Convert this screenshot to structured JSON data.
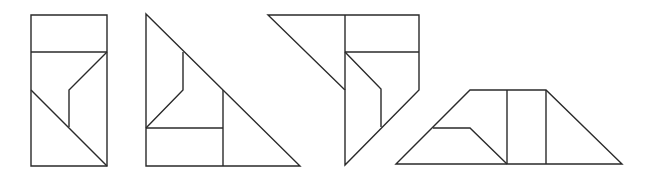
{
  "canvas": {
    "width": 656,
    "height": 176,
    "background": "#ffffff",
    "stroke": "#2a2a2a"
  },
  "figures": [
    {
      "name": "rectangle-tangram",
      "outline": [
        [
          31,
          15
        ],
        [
          107,
          15
        ],
        [
          107,
          166
        ],
        [
          31,
          166
        ]
      ],
      "lines": [
        [
          [
            31,
            52
          ],
          [
            107,
            52
          ]
        ],
        [
          [
            107,
            52
          ],
          [
            69,
            90
          ],
          [
            69,
            127
          ]
        ],
        [
          [
            31,
            90
          ],
          [
            107,
            166
          ]
        ]
      ]
    },
    {
      "name": "triangle-tangram",
      "outline": [
        [
          146,
          14
        ],
        [
          300,
          166
        ],
        [
          146,
          166
        ]
      ],
      "lines": [
        [
          [
            183,
            52
          ],
          [
            183,
            90
          ],
          [
            146,
            128
          ]
        ],
        [
          [
            146,
            128
          ],
          [
            223,
            128
          ]
        ],
        [
          [
            223,
            90
          ],
          [
            223,
            166
          ]
        ]
      ]
    },
    {
      "name": "pentagon-tangram",
      "outline": [
        [
          268,
          15
        ],
        [
          419,
          15
        ],
        [
          419,
          90
        ],
        [
          345,
          165
        ],
        [
          345,
          90
        ]
      ],
      "lines": [
        [
          [
            345,
            15
          ],
          [
            345,
            90
          ]
        ],
        [
          [
            345,
            52
          ],
          [
            419,
            52
          ]
        ],
        [
          [
            345,
            52
          ],
          [
            381,
            89
          ],
          [
            381,
            127
          ]
        ]
      ]
    },
    {
      "name": "trapezoid-tangram",
      "outline": [
        [
          396,
          164
        ],
        [
          470,
          90
        ],
        [
          546,
          90
        ],
        [
          622,
          164
        ]
      ],
      "lines": [
        [
          [
            507,
            90
          ],
          [
            507,
            164
          ]
        ],
        [
          [
            546,
            90
          ],
          [
            546,
            164
          ]
        ],
        [
          [
            433,
            128
          ],
          [
            470,
            128
          ],
          [
            507,
            164
          ]
        ]
      ]
    }
  ]
}
